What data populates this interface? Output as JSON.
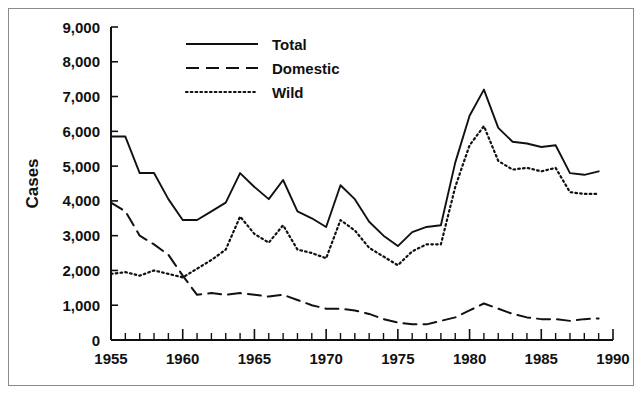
{
  "figure": {
    "border_color": "#8a8a8a",
    "background": "#ffffff"
  },
  "chart_data": {
    "type": "line",
    "title": "",
    "subtitle": "",
    "xlabel": "",
    "ylabel": "Cases",
    "xlim": [
      1955,
      1990
    ],
    "ylim": [
      0,
      9000
    ],
    "grid": false,
    "legend_position": "top-center",
    "y_ticks": [
      0,
      1000,
      2000,
      3000,
      4000,
      5000,
      6000,
      7000,
      8000,
      9000
    ],
    "y_tick_labels": [
      "0",
      "1,000",
      "2,000",
      "3,000",
      "4,000",
      "5,000",
      "6,000",
      "7,000",
      "8,000",
      "9,000"
    ],
    "x_ticks": [
      1955,
      1960,
      1965,
      1970,
      1975,
      1980,
      1985,
      1990
    ],
    "x_tick_labels": [
      "1955",
      "1960",
      "1965",
      "1970",
      "1975",
      "1980",
      "1985",
      "1990"
    ],
    "x_minor_tick_step": 1,
    "x": [
      1955,
      1956,
      1957,
      1958,
      1959,
      1960,
      1961,
      1962,
      1963,
      1964,
      1965,
      1966,
      1967,
      1968,
      1969,
      1970,
      1971,
      1972,
      1973,
      1974,
      1975,
      1976,
      1977,
      1978,
      1979,
      1980,
      1981,
      1982,
      1983,
      1984,
      1985,
      1986,
      1987,
      1988,
      1989
    ],
    "series": [
      {
        "name": "Total",
        "style": "solid",
        "color": "#111111",
        "values": [
          5850,
          5850,
          4800,
          4800,
          4050,
          3450,
          3450,
          3700,
          3950,
          4800,
          4400,
          4050,
          4600,
          3700,
          3500,
          3250,
          4450,
          4050,
          3400,
          3000,
          2700,
          3100,
          3250,
          3300,
          5100,
          6450,
          7200,
          6100,
          5700,
          5650,
          5550,
          5600,
          4800,
          4750,
          4850
        ]
      },
      {
        "name": "Domestic",
        "style": "dashed",
        "color": "#111111",
        "values": [
          3950,
          3700,
          3000,
          2750,
          2450,
          1850,
          1300,
          1350,
          1300,
          1350,
          1300,
          1250,
          1300,
          1150,
          1000,
          900,
          900,
          850,
          750,
          600,
          500,
          450,
          450,
          550,
          650,
          850,
          1050,
          900,
          750,
          650,
          600,
          600,
          550,
          600,
          620
        ]
      },
      {
        "name": "Wild",
        "style": "dotted",
        "color": "#111111",
        "values": [
          1900,
          1950,
          1850,
          2000,
          1900,
          1800,
          2050,
          2300,
          2600,
          3550,
          3050,
          2800,
          3300,
          2600,
          2500,
          2350,
          3450,
          3150,
          2650,
          2400,
          2150,
          2550,
          2750,
          2750,
          4400,
          5600,
          6150,
          5150,
          4900,
          4950,
          4850,
          4950,
          4250,
          4200,
          4200
        ]
      }
    ]
  },
  "legend": {
    "items": [
      {
        "label": "Total",
        "style": "solid"
      },
      {
        "label": "Domestic",
        "style": "dashed"
      },
      {
        "label": "Wild",
        "style": "dotted"
      }
    ]
  }
}
